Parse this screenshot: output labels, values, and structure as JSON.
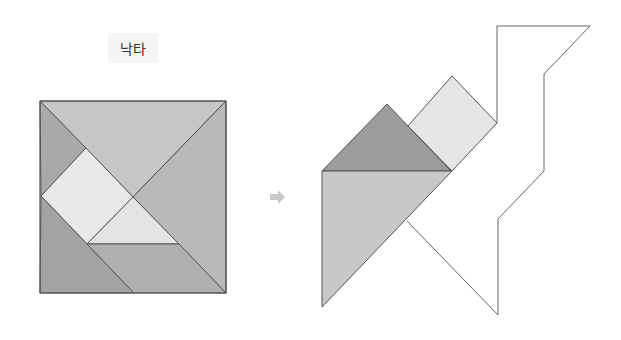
{
  "title": {
    "label": "낙타"
  },
  "arrow": {
    "icon": "right-arrow-icon",
    "color": "#c8c8c8"
  },
  "colors": {
    "outline": "#555555",
    "piece_top_triangle": "#c6c6c6",
    "piece_right_triangle": "#b9b9b9",
    "piece_top_left_small_triangle": "#a9a9a9",
    "piece_square": "#e9e9e9",
    "piece_center_small_triangle": "#e4e4e4",
    "piece_bottom_left_triangle": "#a3a3a3",
    "piece_parallelogram": "#b0b0b0",
    "camel_dark_triangle": "#9c9c9c",
    "camel_square": "#e6e6e6",
    "camel_large_triangle": "#c8c8c8"
  },
  "source_square": {
    "pieces": [
      {
        "name": "top-large-triangle",
        "points": "40,101 226,101 133,197"
      },
      {
        "name": "right-large-triangle",
        "points": "226,101 226,293 133,197"
      },
      {
        "name": "top-left-small-triangle",
        "points": "40,101 86,148 41,196"
      },
      {
        "name": "middle-square",
        "points": "86,148 133,197 87,244 41,196"
      },
      {
        "name": "center-small-triangle",
        "points": "133,197 179,244 87,244"
      },
      {
        "name": "bottom-left-medium-triangle",
        "points": "41,196 134,293 40,293"
      },
      {
        "name": "bottom-parallelogram",
        "points": "87,244 179,244 226,293 134,293"
      }
    ]
  },
  "camel_figure": {
    "pieces": [
      {
        "name": "hump-triangle",
        "points": "387,104 451,171 322,171"
      },
      {
        "name": "neck-square",
        "points": "452,76 497,123 452,171 408,126"
      },
      {
        "name": "body-large-triangle",
        "points": "322,171 452,171 322,307"
      }
    ],
    "outline_points": "497,123 497,26 590,26 544,74 544,171 498,219 498,315 407,221"
  }
}
